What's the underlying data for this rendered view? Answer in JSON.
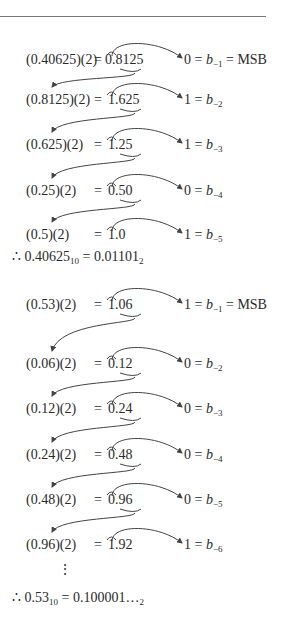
{
  "example1": {
    "rows": [
      {
        "lhs": "(0.40625)(2)",
        "eq": "=",
        "res": "0.8125",
        "bit": "0",
        "sub": "−1",
        "suffix": " = MSB"
      },
      {
        "lhs": "(0.8125)(2)",
        "eq": "=",
        "res": "1.625",
        "bit": "1",
        "sub": "−2",
        "suffix": ""
      },
      {
        "lhs": "(0.625)(2)",
        "eq": "=",
        "res": "1.25",
        "bit": "1",
        "sub": "−3",
        "suffix": ""
      },
      {
        "lhs": "(0.25)(2)",
        "eq": "=",
        "res": "0.50",
        "bit": "0",
        "sub": "−4",
        "suffix": ""
      },
      {
        "lhs": "(0.5)(2)",
        "eq": "=",
        "res": "1.0",
        "bit": "1",
        "sub": "−5",
        "suffix": ""
      }
    ],
    "conclusion": {
      "prefix": "∴ 0.40625",
      "base_in": "10",
      "mid": " = 0.01101",
      "base_out": "2"
    }
  },
  "example2": {
    "rows": [
      {
        "lhs": "(0.53)(2)",
        "eq": "=",
        "res": "1.06",
        "bit": "1",
        "sub": "−1",
        "suffix": " = MSB"
      },
      {
        "lhs": "(0.06)(2)",
        "eq": "=",
        "res": "0.12",
        "bit": "0",
        "sub": "−2",
        "suffix": ""
      },
      {
        "lhs": "(0.12)(2)",
        "eq": "=",
        "res": "0.24",
        "bit": "0",
        "sub": "−3",
        "suffix": ""
      },
      {
        "lhs": "(0.24)(2)",
        "eq": "=",
        "res": "0.48",
        "bit": "0",
        "sub": "−4",
        "suffix": ""
      },
      {
        "lhs": "(0.48)(2)",
        "eq": "=",
        "res": "0.96",
        "bit": "0",
        "sub": "−5",
        "suffix": ""
      },
      {
        "lhs": "(0.96)(2)",
        "eq": "=",
        "res": "1.92",
        "bit": "1",
        "sub": "−6",
        "suffix": ""
      }
    ],
    "ellipsis": "⋮",
    "conclusion": {
      "prefix": "∴ 0.53",
      "base_in": "10",
      "mid": " = 0.100001…",
      "base_out": "2"
    }
  },
  "bit_symbol": "b"
}
